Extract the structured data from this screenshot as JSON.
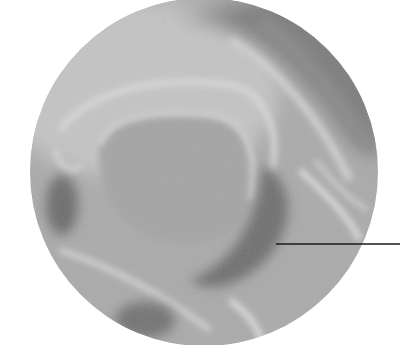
{
  "figure": {
    "kind": "radiograph-detail-circle",
    "background": "#ffffff",
    "circle": {
      "cx": 204,
      "cy": 172,
      "r": 174
    },
    "base_gray": "#a9a9a9",
    "leader_line": {
      "x1": 276,
      "y1": 244,
      "x2": 400,
      "y2": 244,
      "color": "#1a1a1a",
      "width": 1.3
    },
    "labels": []
  }
}
